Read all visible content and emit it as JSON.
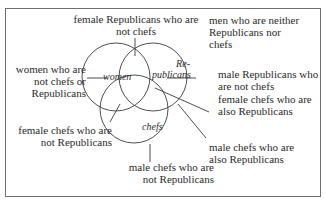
{
  "diagram": {
    "type": "venn",
    "sets": [
      {
        "id": "women",
        "label": "women"
      },
      {
        "id": "republicans",
        "label_line1": "Re-",
        "label_line2": "publicans"
      },
      {
        "id": "chefs",
        "label": "chefs"
      }
    ],
    "annotations": {
      "female_rep_not_chefs": {
        "line1": "female Republicans who are",
        "line2": "not chefs"
      },
      "neither": {
        "line1": "men who are neither",
        "line2": "Republicans nor",
        "line3": "chefs"
      },
      "women_only": {
        "line1": "women who are",
        "line2": "not chefs or",
        "line3": "Republicans"
      },
      "male_rep_not_chefs": {
        "line1": "male Republicans who",
        "line2": "are not chefs"
      },
      "female_chefs_rep": {
        "line1": "female chefs who are",
        "line2": "also Republicans"
      },
      "female_chefs_not_rep": {
        "line1": "female chefs who are",
        "line2": "not Republicans"
      },
      "male_chefs_rep": {
        "line1": "male chefs who are",
        "line2": "also Republicans"
      },
      "male_chefs_not_rep": {
        "line1": "male chefs who are",
        "line2": "not Republicans"
      }
    },
    "colors": {
      "stroke": "#3a3a3a",
      "border": "#6e6e6e",
      "text": "#2a2a2a"
    }
  }
}
